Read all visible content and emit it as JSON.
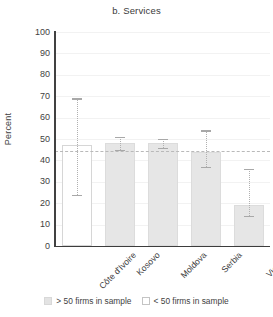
{
  "chart_data": {
    "type": "bar",
    "title": "b. Services",
    "xlabel": "",
    "ylabel": "Percent",
    "ylim": [
      0,
      100
    ],
    "yticks": [
      0,
      10,
      20,
      30,
      40,
      50,
      60,
      70,
      80,
      90,
      100
    ],
    "grid": true,
    "legend_position": "bottom",
    "categories": [
      "Côte d'Ivoire",
      "Kosovo",
      "Moldova",
      "Serbia",
      "Vietnam"
    ],
    "values": [
      47,
      48,
      48,
      44,
      19
    ],
    "error_low": [
      24,
      45,
      46,
      37,
      14
    ],
    "error_high": [
      69,
      51,
      50,
      54,
      36
    ],
    "bar_styles": [
      "hollow",
      "filled",
      "filled",
      "filled",
      "filled"
    ],
    "reference_line": {
      "value": 44.5,
      "style": "dashed",
      "color": "#b9b9b9"
    },
    "legend": [
      {
        "label": "> 50 firms in sample",
        "style": "filled",
        "color": "#e3e3e3"
      },
      {
        "label": "< 50 firms in sample",
        "style": "hollow",
        "color": "#ffffff"
      }
    ]
  }
}
